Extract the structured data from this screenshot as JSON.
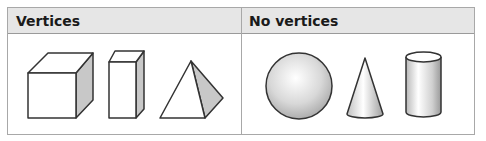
{
  "table": {
    "columns": [
      {
        "label": "Vertices",
        "shapes": [
          "cube",
          "rectangular-prism",
          "pyramid"
        ]
      },
      {
        "label": "No vertices",
        "shapes": [
          "sphere",
          "cone",
          "cylinder"
        ]
      }
    ]
  },
  "colors": {
    "header_bg": "#e6e6e6",
    "border": "#a8a8a8",
    "shade_face": "#c8c8c8",
    "outline": "#333333"
  }
}
